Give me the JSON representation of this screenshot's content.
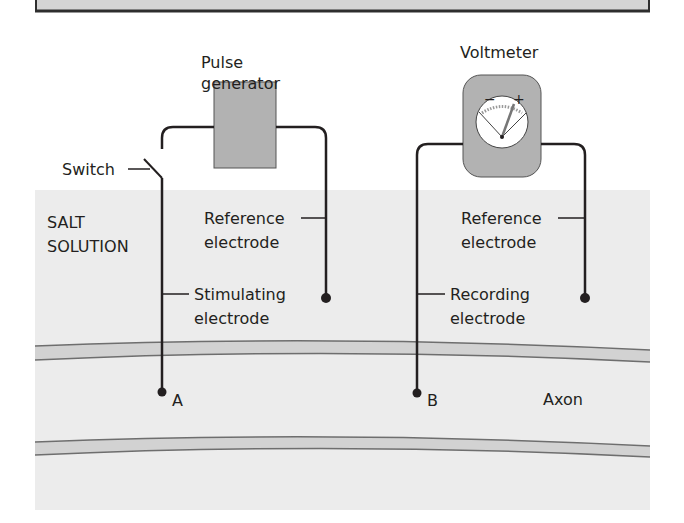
{
  "diagram": {
    "top_bar": {
      "fill": "#d4d4d4",
      "border": "#3a3a3a"
    },
    "solution": {
      "label_line1": "SALT",
      "label_line2": "SOLUTION",
      "fill": "#ececec"
    },
    "axon": {
      "label": "Axon",
      "membrane_fill": "#d2d2d2",
      "membrane_line": "#6e6e6e"
    },
    "pulse_generator": {
      "label_line1": "Pulse",
      "label_line2": "generator",
      "fill": "#b2b2b2"
    },
    "voltmeter": {
      "label": "Voltmeter",
      "fill": "#b2b2b2",
      "minus": "−",
      "plus": "+"
    },
    "switch": {
      "label": "Switch"
    },
    "left_reference": {
      "label_line1": "Reference",
      "label_line2": "electrode"
    },
    "stimulating": {
      "label_line1": "Stimulating",
      "label_line2": "electrode",
      "point": "A"
    },
    "right_reference": {
      "label_line1": "Reference",
      "label_line2": "electrode"
    },
    "recording": {
      "label_line1": "Recording",
      "label_line2": "electrode",
      "point": "B"
    },
    "wire_color": "#231f20"
  }
}
